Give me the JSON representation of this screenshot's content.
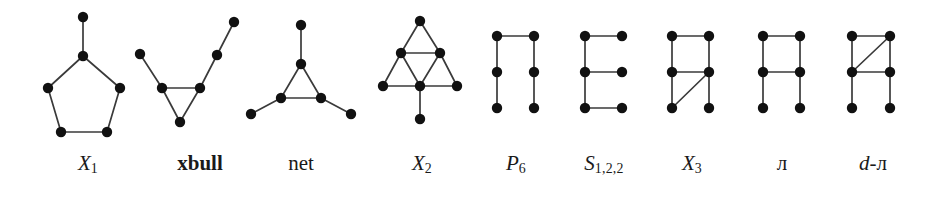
{
  "figure": {
    "name": "forbidden-induced-subgraph-family",
    "background_color": "#ffffff",
    "vertex_color": "#111111",
    "edge_color": "#3a3a3a",
    "label_color": "#1a1a1a",
    "width": 939,
    "height": 198,
    "vertex_radius": 5.2,
    "edge_width": 1.7
  },
  "graphs": [
    {
      "id": "X1",
      "label_text": "X",
      "label_sub": "1",
      "label_style": "italic",
      "label_x": 88,
      "label_y": 168,
      "vertices": [
        {
          "name": "pendant-top",
          "x": 83,
          "y": 17
        },
        {
          "name": "apex",
          "x": 83,
          "y": 56
        },
        {
          "name": "upper-left",
          "x": 48,
          "y": 88
        },
        {
          "name": "upper-right",
          "x": 120,
          "y": 88
        },
        {
          "name": "lower-left",
          "x": 61,
          "y": 132
        },
        {
          "name": "lower-right",
          "x": 107,
          "y": 132
        }
      ],
      "edges": [
        [
          0,
          1
        ],
        [
          1,
          2
        ],
        [
          1,
          3
        ],
        [
          2,
          4
        ],
        [
          3,
          5
        ],
        [
          4,
          5
        ]
      ]
    },
    {
      "id": "xbull",
      "label_text": "xbull",
      "label_sub": "",
      "label_style": "bold",
      "label_x": 200,
      "label_y": 168,
      "vertices": [
        {
          "name": "left-tip",
          "x": 140,
          "y": 54
        },
        {
          "name": "triangle-left",
          "x": 162,
          "y": 88
        },
        {
          "name": "triangle-right",
          "x": 200,
          "y": 88
        },
        {
          "name": "triangle-bottom",
          "x": 180,
          "y": 122
        },
        {
          "name": "right-mid",
          "x": 217,
          "y": 55
        },
        {
          "name": "right-tip",
          "x": 234,
          "y": 22
        }
      ],
      "edges": [
        [
          0,
          1
        ],
        [
          1,
          2
        ],
        [
          1,
          3
        ],
        [
          2,
          3
        ],
        [
          2,
          4
        ],
        [
          4,
          5
        ]
      ]
    },
    {
      "id": "net",
      "label_text": "net",
      "label_sub": "",
      "label_style": "roman",
      "label_x": 301,
      "label_y": 168,
      "vertices": [
        {
          "name": "pendant-top",
          "x": 301,
          "y": 25
        },
        {
          "name": "triangle-top",
          "x": 301,
          "y": 64
        },
        {
          "name": "triangle-left",
          "x": 281,
          "y": 98
        },
        {
          "name": "triangle-right",
          "x": 321,
          "y": 98
        },
        {
          "name": "pendant-left",
          "x": 251,
          "y": 114
        },
        {
          "name": "pendant-right",
          "x": 351,
          "y": 114
        }
      ],
      "edges": [
        [
          0,
          1
        ],
        [
          1,
          2
        ],
        [
          1,
          3
        ],
        [
          2,
          3
        ],
        [
          2,
          4
        ],
        [
          3,
          5
        ]
      ]
    },
    {
      "id": "X2",
      "label_text": "X",
      "label_sub": "2",
      "label_style": "italic",
      "label_x": 422,
      "label_y": 168,
      "vertices": [
        {
          "name": "apex",
          "x": 420,
          "y": 21
        },
        {
          "name": "mid-left",
          "x": 401,
          "y": 53
        },
        {
          "name": "mid-right",
          "x": 440,
          "y": 53
        },
        {
          "name": "base-left",
          "x": 383,
          "y": 86
        },
        {
          "name": "base-center",
          "x": 420,
          "y": 86
        },
        {
          "name": "base-right",
          "x": 457,
          "y": 86
        },
        {
          "name": "pendant-bottom",
          "x": 420,
          "y": 119
        }
      ],
      "edges": [
        [
          0,
          1
        ],
        [
          0,
          2
        ],
        [
          1,
          2
        ],
        [
          1,
          3
        ],
        [
          1,
          4
        ],
        [
          2,
          4
        ],
        [
          2,
          5
        ],
        [
          3,
          4
        ],
        [
          4,
          5
        ],
        [
          4,
          6
        ]
      ]
    },
    {
      "id": "P6",
      "label_text": "P",
      "label_sub": "6",
      "label_style": "italic",
      "label_x": 516,
      "label_y": 168,
      "vertices": [
        {
          "name": "left-top",
          "x": 497,
          "y": 36
        },
        {
          "name": "left-mid",
          "x": 497,
          "y": 72
        },
        {
          "name": "left-bottom",
          "x": 497,
          "y": 108
        },
        {
          "name": "right-top",
          "x": 534,
          "y": 36
        },
        {
          "name": "right-mid",
          "x": 534,
          "y": 72
        },
        {
          "name": "right-bottom",
          "x": 534,
          "y": 108
        }
      ],
      "edges": [
        [
          0,
          1
        ],
        [
          1,
          2
        ],
        [
          0,
          3
        ],
        [
          3,
          4
        ],
        [
          4,
          5
        ]
      ]
    },
    {
      "id": "S122",
      "label_text": "S",
      "label_sub": "1,2,2",
      "label_style": "italic",
      "label_x": 604,
      "label_y": 168,
      "vertices": [
        {
          "name": "spine-top",
          "x": 585,
          "y": 36
        },
        {
          "name": "spine-mid",
          "x": 585,
          "y": 72
        },
        {
          "name": "spine-bottom",
          "x": 585,
          "y": 108
        },
        {
          "name": "arm-top",
          "x": 622,
          "y": 36
        },
        {
          "name": "arm-mid",
          "x": 622,
          "y": 72
        },
        {
          "name": "arm-bottom",
          "x": 622,
          "y": 108
        }
      ],
      "edges": [
        [
          0,
          1
        ],
        [
          1,
          2
        ],
        [
          0,
          3
        ],
        [
          1,
          4
        ],
        [
          2,
          5
        ]
      ]
    },
    {
      "id": "X3",
      "label_text": "X",
      "label_sub": "3",
      "label_style": "italic",
      "label_x": 692,
      "label_y": 168,
      "vertices": [
        {
          "name": "left-top",
          "x": 672,
          "y": 36
        },
        {
          "name": "left-mid",
          "x": 672,
          "y": 72
        },
        {
          "name": "left-bottom",
          "x": 672,
          "y": 108
        },
        {
          "name": "right-top",
          "x": 709,
          "y": 36
        },
        {
          "name": "right-mid",
          "x": 709,
          "y": 72
        },
        {
          "name": "right-bottom",
          "x": 709,
          "y": 108
        }
      ],
      "edges": [
        [
          0,
          1
        ],
        [
          1,
          2
        ],
        [
          3,
          4
        ],
        [
          4,
          5
        ],
        [
          0,
          3
        ],
        [
          1,
          4
        ],
        [
          2,
          4
        ]
      ]
    },
    {
      "id": "A",
      "label_text": "ᴫ",
      "label_sub": "",
      "label_style": "bb",
      "label_x": 782,
      "label_y": 168,
      "vertices": [
        {
          "name": "left-top",
          "x": 763,
          "y": 36
        },
        {
          "name": "left-mid",
          "x": 763,
          "y": 72
        },
        {
          "name": "left-bottom",
          "x": 763,
          "y": 108
        },
        {
          "name": "right-top",
          "x": 800,
          "y": 36
        },
        {
          "name": "right-mid",
          "x": 800,
          "y": 72
        },
        {
          "name": "right-bottom",
          "x": 800,
          "y": 108
        }
      ],
      "edges": [
        [
          0,
          1
        ],
        [
          1,
          2
        ],
        [
          3,
          4
        ],
        [
          4,
          5
        ],
        [
          0,
          3
        ],
        [
          1,
          4
        ]
      ]
    },
    {
      "id": "dA",
      "label_text": "d-ᴫ",
      "label_sub": "",
      "label_style": "italic-prefix",
      "label_x": 873,
      "label_y": 168,
      "vertices": [
        {
          "name": "left-top",
          "x": 852,
          "y": 36
        },
        {
          "name": "left-mid",
          "x": 852,
          "y": 72
        },
        {
          "name": "left-bottom",
          "x": 852,
          "y": 108
        },
        {
          "name": "right-top",
          "x": 890,
          "y": 36
        },
        {
          "name": "right-mid",
          "x": 890,
          "y": 72
        },
        {
          "name": "right-bottom",
          "x": 890,
          "y": 108
        }
      ],
      "edges": [
        [
          0,
          1
        ],
        [
          1,
          2
        ],
        [
          3,
          4
        ],
        [
          4,
          5
        ],
        [
          0,
          3
        ],
        [
          1,
          4
        ],
        [
          1,
          3
        ]
      ]
    }
  ],
  "labels": {
    "X1": "X1",
    "xbull": "xbull",
    "net": "net",
    "X2": "X2",
    "P6": "P6",
    "S122": "S1,2,2",
    "X3": "X3",
    "A": "A",
    "dA": "d-A"
  }
}
